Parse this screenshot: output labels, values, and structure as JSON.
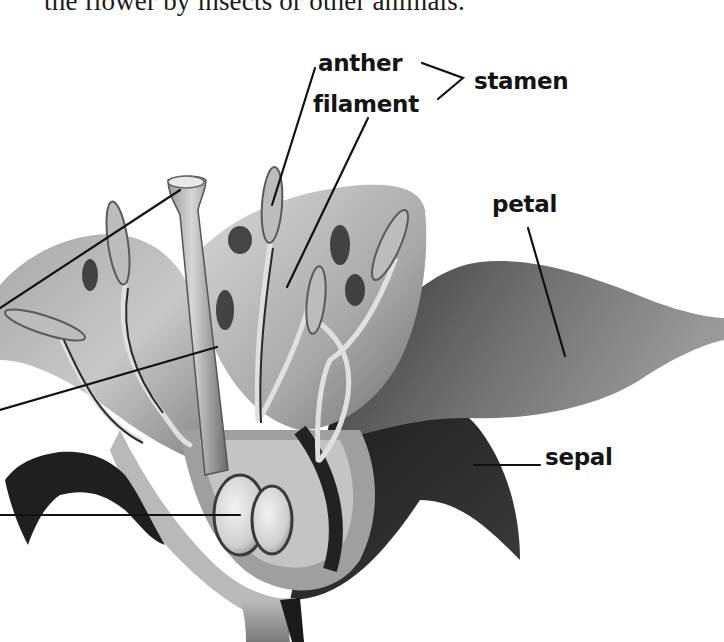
{
  "body_text": {
    "cropped_line": "the flower by insects or other animals."
  },
  "figure": {
    "style": "grayscale 3D rendering",
    "labels": {
      "anther": "anther",
      "filament": "filament",
      "stamen": "stamen",
      "petal": "petal",
      "sepal": "sepal"
    },
    "offscreen_left_leaders": 3,
    "colors": {
      "background": "#ffffff",
      "label_text": "#141414",
      "leader_line": "#111111",
      "petal_light": "#c9c9c9",
      "petal_mid": "#8c8c8c",
      "petal_dark": "#4a4a4a",
      "sepal_dark": "#262626"
    }
  }
}
